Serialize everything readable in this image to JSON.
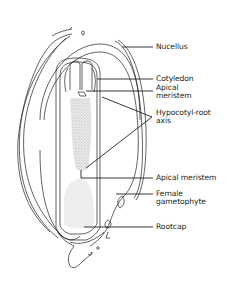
{
  "diagram": {
    "line_color": "#231f20",
    "shading_color": "#b9b9b9",
    "labels": [
      {
        "id": "nucellus",
        "text": "Nucellus"
      },
      {
        "id": "cotyledon",
        "text": "Cotyledon"
      },
      {
        "id": "apical-meristem-shoot",
        "text": "Apical meristem"
      },
      {
        "id": "hypocotyl-root-axis",
        "text": "Hypocotyl-root axis"
      },
      {
        "id": "apical-meristem-root",
        "text": "Apical meristem"
      },
      {
        "id": "female-gametophyte",
        "text": "Female gametophyte"
      },
      {
        "id": "rootcap",
        "text": "Rootcap"
      }
    ]
  },
  "labels": {
    "nucellus": "Nucellus",
    "cotyledon": "Cotyledon",
    "apical_shoot_line1": "Apical",
    "apical_shoot_line2": "meristem",
    "hypocotyl_line1": "Hypocotyl-root",
    "hypocotyl_line2": "axis",
    "apical_root": "Apical meristem",
    "female_line1": "Female",
    "female_line2": "gametophyte",
    "rootcap": "Rootcap"
  }
}
